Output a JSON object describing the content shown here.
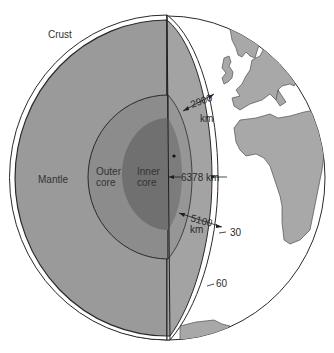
{
  "title_fragment": "",
  "labels": {
    "crust": "Crust",
    "mantle": "Mantle",
    "outer_core_line1": "Outer",
    "outer_core_line2": "core",
    "inner_core_line1": "Inner",
    "inner_core_line2": "core"
  },
  "dimensions": {
    "mantle_depth_value": "2900",
    "mantle_depth_unit": "km",
    "earth_radius": "6378 km",
    "outer_core_depth_value": "5100",
    "outer_core_depth_unit": "km"
  },
  "latitude_marks": {
    "lat_30": "30",
    "lat_60": "60"
  },
  "colors": {
    "background": "#ffffff",
    "mantle": "#9a9a9a",
    "outer_core": "#8a8a8a",
    "inner_core": "#6f6f6f",
    "land": "#a8a8a8",
    "ocean": "#ffffff",
    "outline": "#2a2a2a"
  }
}
